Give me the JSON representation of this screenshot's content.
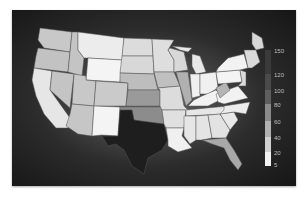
{
  "map": {
    "type": "choropleth",
    "region": "United States (contiguous)",
    "colormap": "grayscale",
    "states": {
      "TX": {
        "shade": "#1e1e1e",
        "bucket": "150"
      },
      "OK": {
        "shade": "#8c8c8c",
        "bucket": "80-100"
      },
      "NM": {
        "shade": "#f4f4f4",
        "bucket": "5-20"
      },
      "WY": {
        "shade": "#f4f4f4",
        "bucket": "5-20"
      },
      "MT": {
        "shade": "#ececec",
        "bucket": "5-20"
      },
      "WA": {
        "shade": "#c8c8c8",
        "bucket": "40-60"
      },
      "OR": {
        "shade": "#c2c2c2",
        "bucket": "40-60"
      },
      "CA": {
        "shade": "#e6e6e6",
        "bucket": "20-40"
      },
      "NV": {
        "shade": "#c4c4c4",
        "bucket": "40-60"
      },
      "ID": {
        "shade": "#c4c4c4",
        "bucket": "40-60"
      },
      "UT": {
        "shade": "#c8c8c8",
        "bucket": "40-60"
      },
      "AZ": {
        "shade": "#c6c6c6",
        "bucket": "40-60"
      },
      "CO": {
        "shade": "#cacaca",
        "bucket": "40-60"
      },
      "ND": {
        "shade": "#dcdcdc",
        "bucket": "20-40"
      },
      "SD": {
        "shade": "#d8d8d8",
        "bucket": "20-40"
      },
      "NE": {
        "shade": "#bdbdbd",
        "bucket": "40-60"
      },
      "KS": {
        "shade": "#9a9a9a",
        "bucket": "60-80"
      },
      "MN": {
        "shade": "#dedede",
        "bucket": "20-40"
      },
      "IA": {
        "shade": "#c0c0c0",
        "bucket": "40-60"
      },
      "MO": {
        "shade": "#dcdcdc",
        "bucket": "20-40"
      },
      "AR": {
        "shade": "#e0e0e0",
        "bucket": "20-40"
      },
      "LA": {
        "shade": "#f0f0f0",
        "bucket": "5-20"
      },
      "WI": {
        "shade": "#d8d8d8",
        "bucket": "20-40"
      },
      "IL": {
        "shade": "#b0b0b0",
        "bucket": "40-60"
      },
      "MI": {
        "shade": "#e8e8e8",
        "bucket": "20-40"
      },
      "IN": {
        "shade": "#f0f0f0",
        "bucket": "5-20"
      },
      "OH": {
        "shade": "#f0f0f0",
        "bucket": "5-20"
      },
      "KY": {
        "shade": "#f2f2f2",
        "bucket": "5-20"
      },
      "TN": {
        "shade": "#e6e6e6",
        "bucket": "20-40"
      },
      "MS": {
        "shade": "#e6e6e6",
        "bucket": "20-40"
      },
      "AL": {
        "shade": "#e4e4e4",
        "bucket": "20-40"
      },
      "GA": {
        "shade": "#e2e2e2",
        "bucket": "20-40"
      },
      "FL": {
        "shade": "#a8a8a8",
        "bucket": "60-80"
      },
      "SC": {
        "shade": "#e8e8e8",
        "bucket": "20-40"
      },
      "NC": {
        "shade": "#ececec",
        "bucket": "20-40"
      },
      "VA": {
        "shade": "#f2f2f2",
        "bucket": "5-20"
      },
      "WV": {
        "shade": "#b4b4b4",
        "bucket": "40-60"
      },
      "PA": {
        "shade": "#f4f4f4",
        "bucket": "5-20"
      },
      "NY": {
        "shade": "#f2f2f2",
        "bucket": "5-20"
      },
      "NE_states": {
        "shade": "#dadada",
        "bucket": "20-40"
      },
      "ME": {
        "shade": "#d6d6d6",
        "bucket": "20-40"
      }
    }
  },
  "legend": {
    "ticks": [
      "150",
      "120",
      "100",
      "80",
      "60",
      "40",
      "20",
      "5"
    ],
    "segments": [
      {
        "from": 120,
        "to": 150,
        "color": "#3a3a3a"
      },
      {
        "from": 100,
        "to": 120,
        "color": "#4a4a4a"
      },
      {
        "from": 80,
        "to": 100,
        "color": "#5e5e5e"
      },
      {
        "from": 60,
        "to": 80,
        "color": "#8a8a8a"
      },
      {
        "from": 40,
        "to": 60,
        "color": "#b0b0b0"
      },
      {
        "from": 20,
        "to": 40,
        "color": "#d0d0d0"
      },
      {
        "from": 5,
        "to": 20,
        "color": "#f2f2f2"
      }
    ]
  }
}
